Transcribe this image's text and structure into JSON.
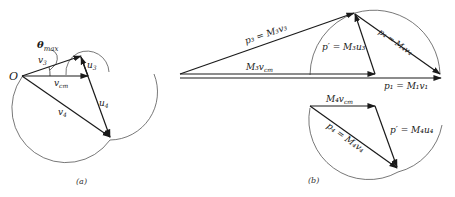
{
  "figure_a": {
    "caption": "(a)",
    "origin_label": "O",
    "theta_label": "θ",
    "theta_sub": "max",
    "v3_label": "v",
    "v3_sub": "3",
    "vcm_label": "v",
    "vcm_sub": "cm",
    "u3_label": "u",
    "u3_sub": "3",
    "u4_label": "u",
    "u4_sub": "4",
    "v4_label": "v",
    "v4_sub": "4"
  },
  "figure_b": {
    "caption": "(b)",
    "p3_label": "p₃ = M₃v₃",
    "pprime_top_label": "p′ = M₃u₃",
    "p4_top_label": "p₄ = M₄v₄",
    "m3vcm_label": "M₃v",
    "m3vcm_sub": "cm",
    "p1_label": "p₁ = M₁v₁",
    "m4vcm_label": "M₄v",
    "m4vcm_sub": "cm",
    "p4_bottom_label": "p₄ = M₄v₄",
    "pprime_bottom_label": "p′ = M₄u₄"
  },
  "colors": {
    "line": "#1a1a1a",
    "arc": "#555555",
    "background": "#ffffff"
  }
}
